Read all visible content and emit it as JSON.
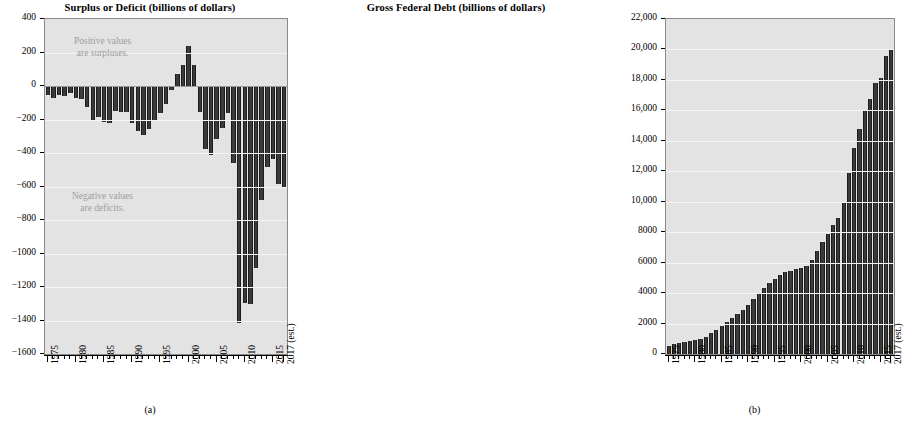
{
  "figure": {
    "panel_a_caption": "(a)",
    "panel_b_caption": "(b)"
  },
  "chart_data": [
    {
      "type": "bar",
      "panel": "(a)",
      "title": "Surplus or Deficit (billions of dollars)",
      "xlabel": "",
      "ylabel": "",
      "ylim": [
        -1600,
        400
      ],
      "ytick_labels": [
        "400",
        "200",
        "0",
        "−200",
        "−400",
        "−600",
        "−800",
        "−1000",
        "−1200",
        "−1400",
        "−1600"
      ],
      "ytick_values": [
        400,
        200,
        0,
        -200,
        -400,
        -600,
        -800,
        -1000,
        -1200,
        -1400,
        -1600
      ],
      "grid": true,
      "legend": "none",
      "xtick_labels": [
        "1975",
        "1980",
        "1985",
        "1990",
        "1995",
        "2000",
        "2005",
        "2010",
        "2015",
        "2017 (est.)"
      ],
      "xtick_years": [
        1975,
        1980,
        1985,
        1990,
        1995,
        2000,
        2005,
        2010,
        2015,
        2017
      ],
      "annotations": [
        {
          "id": "positive",
          "line1": "Positive values",
          "line2": "are surpluses."
        },
        {
          "id": "negative",
          "line1": "Negative values",
          "line2": "are deficits."
        }
      ],
      "categories": [
        1975,
        1976,
        1977,
        1978,
        1979,
        1980,
        1981,
        1982,
        1983,
        1984,
        1985,
        1986,
        1987,
        1988,
        1989,
        1990,
        1991,
        1992,
        1993,
        1994,
        1995,
        1996,
        1997,
        1998,
        1999,
        2000,
        2001,
        2002,
        2003,
        2004,
        2005,
        2006,
        2007,
        2008,
        2009,
        2010,
        2011,
        2012,
        2013,
        2014,
        2015,
        2016,
        2017
      ],
      "values": [
        -53,
        -74,
        -54,
        -59,
        -41,
        -74,
        -79,
        -128,
        -208,
        -185,
        -212,
        -221,
        -150,
        -155,
        -153,
        -221,
        -269,
        -290,
        -255,
        -203,
        -164,
        -107,
        -22,
        69,
        126,
        236,
        128,
        -158,
        -378,
        -413,
        -318,
        -248,
        -161,
        -459,
        -1413,
        -1294,
        -1300,
        -1087,
        -680,
        -485,
        -438,
        -585,
        -603
      ]
    },
    {
      "type": "bar",
      "panel": "(b)",
      "title": "Gross Federal Debt (billions of dollars)",
      "xlabel": "",
      "ylabel": "",
      "ylim": [
        0,
        22000
      ],
      "ytick_labels": [
        "22,000",
        "20,000",
        "18,000",
        "16,000",
        "14,000",
        "12,000",
        "10,000",
        "8000",
        "6000",
        "4000",
        "2000",
        "0"
      ],
      "ytick_values": [
        22000,
        20000,
        18000,
        16000,
        14000,
        12000,
        10000,
        8000,
        6000,
        4000,
        2000,
        0
      ],
      "grid": true,
      "legend": "none",
      "xtick_labels": [
        "1975",
        "1980",
        "1985",
        "1990",
        "1995",
        "2000",
        "2005",
        "2010",
        "2015",
        "2017 (est.)"
      ],
      "xtick_years": [
        1975,
        1980,
        1985,
        1990,
        1995,
        2000,
        2005,
        2010,
        2015,
        2017
      ],
      "annotations": [],
      "categories": [
        1975,
        1976,
        1977,
        1978,
        1979,
        1980,
        1981,
        1982,
        1983,
        1984,
        1985,
        1986,
        1987,
        1988,
        1989,
        1990,
        1991,
        1992,
        1993,
        1994,
        1995,
        1996,
        1997,
        1998,
        1999,
        2000,
        2001,
        2002,
        2003,
        2004,
        2005,
        2006,
        2007,
        2008,
        2009,
        2010,
        2011,
        2012,
        2013,
        2014,
        2015,
        2016,
        2017
      ],
      "values": [
        542,
        629,
        706,
        777,
        829,
        909,
        995,
        1137,
        1372,
        1565,
        1817,
        2120,
        2346,
        2601,
        2868,
        3206,
        3598,
        4002,
        4351,
        4643,
        4921,
        5181,
        5369,
        5478,
        5606,
        5629,
        5770,
        6198,
        6760,
        7355,
        7905,
        8451,
        8951,
        9986,
        11876,
        13529,
        14764,
        16051,
        16719,
        17794,
        18120,
        19539,
        20056
      ]
    }
  ]
}
